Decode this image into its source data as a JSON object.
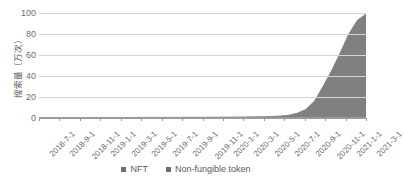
{
  "chart_data": {
    "type": "area",
    "title": "",
    "xlabel": "",
    "ylabel": "搜索量（万次）",
    "ylim": [
      0,
      100
    ],
    "yticks": [
      0,
      20,
      40,
      60,
      80,
      100
    ],
    "grid": true,
    "legend_position": "bottom-center",
    "x_tick_labels": [
      "2018-7-1",
      "2018-9-1",
      "2018-11-1",
      "2019-1-1",
      "2019-3-1",
      "2019-5-1",
      "2019-7-1",
      "2019-9-1",
      "2019-11-1",
      "2020-1-1",
      "2020-3-1",
      "2020-5-1",
      "2020-7-1",
      "2020-9-1",
      "2020-11-1",
      "2021-1-1",
      "2021-3-1"
    ],
    "x": [
      "2018-7-1",
      "2018-8-1",
      "2018-9-1",
      "2018-10-1",
      "2018-11-1",
      "2018-12-1",
      "2019-1-1",
      "2019-2-1",
      "2019-3-1",
      "2019-4-1",
      "2019-5-1",
      "2019-6-1",
      "2019-7-1",
      "2019-8-1",
      "2019-9-1",
      "2019-10-1",
      "2019-11-1",
      "2019-12-1",
      "2020-1-1",
      "2020-2-1",
      "2020-3-1",
      "2020-4-1",
      "2020-5-1",
      "2020-6-1",
      "2020-7-1",
      "2020-8-1",
      "2020-9-1",
      "2020-10-1",
      "2020-11-1",
      "2020-12-1",
      "2021-1-1",
      "2021-1-15",
      "2021-2-1",
      "2021-2-10",
      "2021-2-15",
      "2021-2-20",
      "2021-2-25",
      "2021-2-28",
      "2021-3-1"
    ],
    "series": [
      {
        "name": "NFT",
        "color": "#808080",
        "values": [
          0.3,
          0.3,
          0.4,
          0.4,
          0.4,
          0.4,
          0.5,
          0.5,
          0.5,
          0.5,
          0.5,
          0.5,
          0.6,
          0.6,
          0.6,
          0.6,
          0.6,
          0.7,
          0.7,
          0.7,
          0.8,
          0.8,
          0.9,
          0.9,
          1.0,
          1.1,
          1.2,
          1.4,
          1.8,
          2.6,
          4.5,
          8.0,
          16.0,
          30.0,
          45.0,
          62.0,
          80.0,
          93.0,
          99.0
        ]
      },
      {
        "name": "Non-fungible token",
        "color": "#9c9c9c",
        "values": [
          0.1,
          0.1,
          0.1,
          0.1,
          0.1,
          0.1,
          0.1,
          0.1,
          0.1,
          0.1,
          0.1,
          0.1,
          0.1,
          0.1,
          0.1,
          0.1,
          0.1,
          0.1,
          0.1,
          0.1,
          0.1,
          0.1,
          0.1,
          0.2,
          0.2,
          0.2,
          0.2,
          0.2,
          0.3,
          0.4,
          0.6,
          1.0,
          1.8,
          3.0,
          4.2,
          5.5,
          6.8,
          7.6,
          8.0
        ]
      }
    ],
    "legend": [
      {
        "label": "NFT",
        "color": "#6e6e6e"
      },
      {
        "label": "Non-fungible token",
        "color": "#6e6e6e"
      }
    ]
  },
  "colors": {
    "background": "#ffffff",
    "gridline": "#d4d4d4",
    "axis": "#9a9a9a",
    "tick_text": "#6b6b6b",
    "label_text": "#595959",
    "series_primary": "#808080",
    "series_secondary": "#9c9c9c"
  }
}
